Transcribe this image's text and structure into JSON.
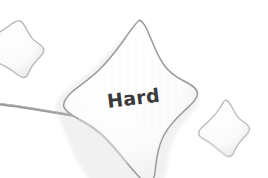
{
  "scene": {
    "width": 268,
    "height": 178,
    "background_color": "#ffffff",
    "description": "Photograph of a plush felt star craft labeled Hard, with two smaller stars and a thin wire"
  },
  "main_star": {
    "label": "Hard",
    "label_color": "#3a3a3a",
    "fill_color": "#fbfbfb",
    "outline_color": "#9a9a9a",
    "shadow_color": "#e2e2e2"
  },
  "small_star_left": {
    "name": "small-star-left",
    "fill_color": "#fcfcfc",
    "outline_color": "#b8b8b8"
  },
  "small_star_right": {
    "name": "small-star-right",
    "fill_color": "#fcfcfc",
    "outline_color": "#bdbdbd"
  },
  "wire": {
    "name": "wire",
    "color": "#8f8f8f"
  }
}
